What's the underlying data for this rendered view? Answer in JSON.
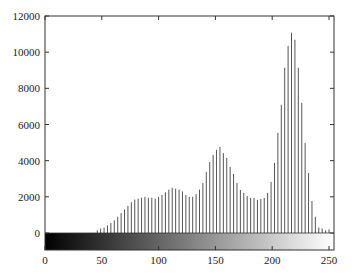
{
  "chart_data": {
    "type": "bar",
    "title": "",
    "xlabel": "",
    "ylabel": "",
    "xlim": [
      0,
      255
    ],
    "ylim": [
      -1000,
      12000
    ],
    "xticks": [
      0,
      50,
      100,
      150,
      200,
      250
    ],
    "yticks": [
      0,
      2000,
      4000,
      6000,
      8000,
      10000,
      12000
    ],
    "grid": false,
    "legend": null,
    "colorbar": {
      "description": "grayscale gradient bar from black (0) to white (255) below the zero line"
    },
    "series": [
      {
        "name": "histogram",
        "x": [
          46,
          49,
          52,
          55,
          58,
          61,
          64,
          67,
          70,
          73,
          76,
          79,
          82,
          85,
          88,
          91,
          94,
          97,
          100,
          103,
          106,
          109,
          112,
          115,
          118,
          121,
          124,
          127,
          130,
          133,
          136,
          139,
          142,
          145,
          148,
          151,
          154,
          157,
          160,
          163,
          166,
          169,
          172,
          175,
          178,
          181,
          184,
          187,
          190,
          193,
          196,
          199,
          202,
          205,
          208,
          211,
          214,
          217,
          220,
          223,
          226,
          229,
          232,
          235,
          238,
          241,
          244,
          247,
          250
        ],
        "values": [
          150,
          250,
          300,
          420,
          550,
          700,
          900,
          1100,
          1300,
          1500,
          1700,
          1850,
          1900,
          1950,
          2000,
          1950,
          1950,
          1900,
          2000,
          2100,
          2250,
          2400,
          2500,
          2450,
          2400,
          2300,
          2100,
          2000,
          2000,
          2150,
          2400,
          2770,
          3380,
          3930,
          4320,
          4600,
          4760,
          4420,
          4150,
          3650,
          3270,
          2770,
          2380,
          2220,
          2050,
          1940,
          1940,
          1830,
          1880,
          1940,
          2220,
          2830,
          3880,
          5540,
          7090,
          9140,
          10350,
          11080,
          10690,
          9140,
          7200,
          4980,
          3320,
          1770,
          900,
          300,
          250,
          150,
          200
        ]
      }
    ]
  },
  "axes": {
    "y_tick_labels": [
      "0",
      "2000",
      "4000",
      "6000",
      "8000",
      "10000",
      "12000"
    ],
    "x_tick_labels": [
      "0",
      "50",
      "100",
      "150",
      "200",
      "250"
    ]
  },
  "colors": {
    "bar": "#555555",
    "axis": "#333333",
    "background": "#ffffff"
  }
}
